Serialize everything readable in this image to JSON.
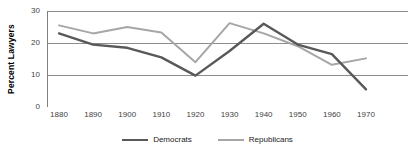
{
  "chart_data": {
    "type": "line",
    "title": "",
    "xlabel": "",
    "ylabel": "Percent Lawyers",
    "x": [
      1880,
      1890,
      1900,
      1910,
      1920,
      1930,
      1940,
      1950,
      1960,
      1970
    ],
    "categories": [
      "1880",
      "1890",
      "1900",
      "1910",
      "1920",
      "1930",
      "1940",
      "1950",
      "1960",
      "1970"
    ],
    "xlim": [
      1880,
      1970
    ],
    "ylim": [
      0,
      30
    ],
    "yticks": [
      0,
      10,
      20,
      30
    ],
    "ytick_labels": [
      "0",
      "10",
      "20",
      "30"
    ],
    "grid": "horizontal",
    "legend_position": "bottom-center",
    "series": [
      {
        "name": "Democrats",
        "color": "#595959",
        "values": [
          23.0,
          19.5,
          18.5,
          15.5,
          9.8,
          17.5,
          26.0,
          19.5,
          16.5,
          5.5
        ]
      },
      {
        "name": "Republicans",
        "color": "#a6a6a6",
        "values": [
          25.5,
          23.0,
          25.0,
          23.3,
          14.0,
          26.2,
          23.0,
          19.0,
          13.2,
          15.2
        ]
      }
    ]
  },
  "axis": {
    "y_title": "Percent Lawyers"
  },
  "legend": {
    "items": [
      {
        "label": "Democrats",
        "color": "#595959"
      },
      {
        "label": "Republicans",
        "color": "#a6a6a6"
      }
    ]
  },
  "colors": {
    "democrats": "#595959",
    "republicans": "#a6a6a6",
    "gridline": "#808080",
    "axis": "#808080",
    "tick_text": "#3f3f3f"
  }
}
